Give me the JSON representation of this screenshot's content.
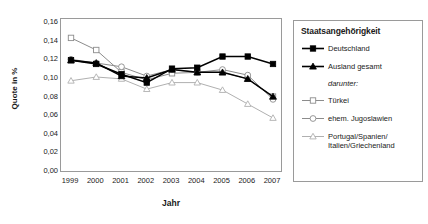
{
  "chart_data": {
    "type": "line",
    "title": "",
    "xlabel": "Jahr",
    "ylabel": "Quote in %",
    "categories": [
      "1999",
      "2000",
      "2001",
      "2002",
      "2003",
      "2004",
      "2005",
      "2006",
      "2007"
    ],
    "x": [
      1999,
      2000,
      2001,
      2002,
      2003,
      2004,
      2005,
      2006,
      2007
    ],
    "ylim": [
      0.0,
      0.16
    ],
    "yticks": [
      "0,00",
      "0,02",
      "0,04",
      "0,06",
      "0,08",
      "0,10",
      "0,12",
      "0,14",
      "0,16"
    ],
    "ytick_values": [
      0.0,
      0.02,
      0.04,
      0.06,
      0.08,
      0.1,
      0.12,
      0.14,
      0.16
    ],
    "grid": false,
    "legend_position": "right",
    "legend_title": "Staatsangehörigkeit",
    "legend_note": "darunter:",
    "series": [
      {
        "name": "Deutschland",
        "marker": "filled-square",
        "color": "#000000",
        "values": [
          0.12,
          0.116,
          0.105,
          0.096,
          0.111,
          0.112,
          0.124,
          0.124,
          0.116
        ]
      },
      {
        "name": "Ausland gesamt",
        "marker": "filled-triangle",
        "color": "#000000",
        "values": [
          0.12,
          0.117,
          0.103,
          0.101,
          0.11,
          0.107,
          0.107,
          0.1,
          0.081
        ]
      },
      {
        "name": "Türkei",
        "marker": "open-square",
        "color": "#8c8c8c",
        "values": [
          0.144,
          0.131,
          0.107,
          0.099,
          0.106,
          0.107,
          0.107,
          0.1,
          0.081
        ]
      },
      {
        "name": "ehem. Jugoslawien",
        "marker": "open-circle",
        "color": "#8c8c8c",
        "values": [
          0.121,
          0.117,
          0.113,
          0.103,
          0.11,
          0.107,
          0.11,
          0.104,
          0.078
        ]
      },
      {
        "name": "Portugal/Spanien/\nItalien/Griechenland",
        "marker": "open-triangle",
        "color": "#b0b0b0",
        "values": [
          0.098,
          0.102,
          0.1,
          0.089,
          0.096,
          0.096,
          0.088,
          0.073,
          0.058
        ]
      }
    ]
  },
  "legend": {
    "title": "Staatsangehörigkeit",
    "note": "darunter:",
    "items": [
      {
        "label": "Deutschland"
      },
      {
        "label": "Ausland gesamt"
      },
      {
        "label": "Türkei"
      },
      {
        "label": "ehem. Jugoslawien"
      },
      {
        "label": "Portugal/Spanien/",
        "label2": "Italien/Griechenland"
      }
    ]
  },
  "axes": {
    "ylabel": "Quote in %",
    "xlabel": "Jahr"
  }
}
